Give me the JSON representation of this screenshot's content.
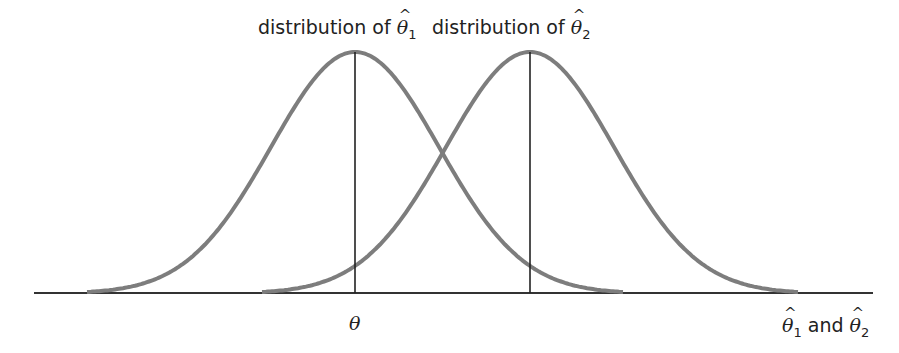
{
  "diagram": {
    "labels": {
      "dist1_prefix": "distribution of ",
      "dist1_symbol": "θ",
      "dist1_hat": "^",
      "dist1_sub": "1",
      "dist2_prefix": "distribution of ",
      "dist2_symbol": "θ",
      "dist2_hat": "^",
      "dist2_sub": "2",
      "center_label": "θ",
      "axis_label_sym1": "θ",
      "axis_label_sub1": "1",
      "axis_label_and": " and ",
      "axis_label_sym2": "θ",
      "axis_label_sub2": "2",
      "axis_hat": "^"
    },
    "colors": {
      "curve": "#7d7d7d",
      "axis": "#333333",
      "text": "#222222"
    },
    "geometry": {
      "baseline_y": 293,
      "axis_x_start": 34,
      "axis_x_end": 873,
      "peak_y": 52,
      "curve1_center_x": 355,
      "curve2_center_x": 530,
      "half_width": 268,
      "sigma": 84
    }
  }
}
